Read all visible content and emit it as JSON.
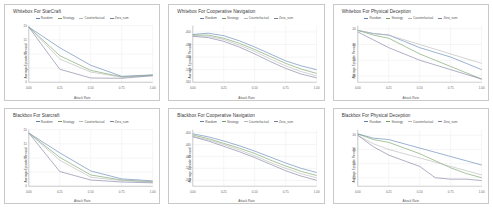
{
  "figure": {
    "name": "attack-rate-reward-grid",
    "rows": 2,
    "cols": 3,
    "background": "#ffffff"
  },
  "legend_series": [
    {
      "key": "random",
      "label": "Random",
      "color": "#5b7fb5"
    },
    {
      "key": "strategy",
      "label": "Strategy",
      "color": "#6f9e5e"
    },
    {
      "key": "counterfactual",
      "label": "Counterfactual",
      "color": "#b6b6b6"
    },
    {
      "key": "zero_sum",
      "label": "Zero_sum",
      "color": "#7b7b9e"
    }
  ],
  "axes": {
    "xlabel": "Attack Rate",
    "ylabel": "Average Episode Reward",
    "xticks": [
      "0.00",
      "0.25",
      "0.50",
      "0.75",
      "1.00"
    ],
    "xlim": [
      0,
      1
    ],
    "grid": true
  },
  "chart_data": [
    {
      "id": "whitebox-starcraft",
      "type": "line",
      "title": "Whitebox For StarCraft",
      "xlabel": "Attack Rate",
      "ylabel": "Average Episode Reward",
      "x": [
        0.0,
        0.25,
        0.5,
        0.75,
        1.0
      ],
      "ylim": [
        0,
        20
      ],
      "yticks": [
        "0",
        "5",
        "10",
        "15",
        "20"
      ],
      "series": [
        {
          "name": "Random",
          "values": [
            19.5,
            12.2,
            6.0,
            2.1,
            2.6
          ]
        },
        {
          "name": "Strategy",
          "values": [
            19.5,
            9.4,
            4.2,
            1.9,
            2.5
          ]
        },
        {
          "name": "Counterfactual",
          "values": [
            19.5,
            8.2,
            3.6,
            1.8,
            2.4
          ]
        },
        {
          "name": "Zero_sum",
          "values": [
            19.5,
            4.6,
            1.5,
            1.4,
            2.3
          ]
        }
      ]
    },
    {
      "id": "whitebox-cooperative-navigation",
      "type": "line",
      "title": "Whitebox For Cooperative Navigation",
      "xlabel": "Attack Rate",
      "ylabel": "Average Episode Reward",
      "x": [
        0.0,
        0.125,
        0.25,
        0.375,
        0.5,
        0.625,
        0.75,
        0.875,
        1.0
      ],
      "ylim": [
        -560,
        -380
      ],
      "yticks": [
        "-400",
        "-440",
        "-480",
        "-520",
        "-560"
      ],
      "series": [
        {
          "name": "Random",
          "values": [
            -408,
            -404,
            -412,
            -428,
            -448,
            -470,
            -492,
            -508,
            -520
          ]
        },
        {
          "name": "Strategy",
          "values": [
            -410,
            -410,
            -420,
            -436,
            -456,
            -478,
            -500,
            -518,
            -532
          ]
        },
        {
          "name": "Counterfactual",
          "values": [
            -412,
            -414,
            -424,
            -442,
            -462,
            -486,
            -508,
            -526,
            -540
          ]
        },
        {
          "name": "Zero_sum",
          "values": [
            -414,
            -418,
            -430,
            -448,
            -470,
            -494,
            -516,
            -534,
            -546
          ]
        }
      ]
    },
    {
      "id": "whitebox-physical-deception",
      "type": "line",
      "title": "Whitebox For Physical Deception",
      "xlabel": "Attack Rate",
      "ylabel": "Average Episode Reward",
      "x": [
        0.0,
        0.125,
        0.25,
        0.375,
        0.5,
        0.625,
        0.75,
        0.875,
        1.0
      ],
      "ylim": [
        -64,
        -28
      ],
      "yticks": [
        "-30",
        "-40",
        "-50",
        "-60"
      ],
      "series": [
        {
          "name": "Random",
          "values": [
            -31,
            -33,
            -34,
            -38,
            -42,
            -45,
            -48,
            -52,
            -56
          ]
        },
        {
          "name": "Strategy",
          "values": [
            -31,
            -34,
            -36,
            -41,
            -46,
            -50,
            -54,
            -58,
            -62
          ]
        },
        {
          "name": "Counterfactual",
          "values": [
            -31,
            -33,
            -34,
            -37,
            -40,
            -43,
            -46,
            -49,
            -52
          ]
        },
        {
          "name": "Zero_sum",
          "values": [
            -32,
            -37,
            -42,
            -46,
            -50,
            -53,
            -56,
            -59,
            -62
          ]
        }
      ]
    },
    {
      "id": "blackbox-starcraft",
      "type": "line",
      "title": "Blackbox For Starcraft",
      "xlabel": "Attack Rate",
      "ylabel": "Average Episode Reward",
      "x": [
        0.0,
        0.25,
        0.5,
        0.75,
        1.0
      ],
      "ylim": [
        0,
        20
      ],
      "yticks": [
        "0",
        "5",
        "10",
        "15",
        "20"
      ],
      "series": [
        {
          "name": "Random",
          "values": [
            18.8,
            11.8,
            5.4,
            2.6,
            1.9
          ]
        },
        {
          "name": "Strategy",
          "values": [
            18.8,
            10.2,
            4.0,
            2.2,
            1.6
          ]
        },
        {
          "name": "Counterfactual",
          "values": [
            18.8,
            9.2,
            3.2,
            2.0,
            1.5
          ]
        },
        {
          "name": "Zero_sum",
          "values": [
            18.8,
            5.2,
            2.2,
            1.5,
            1.2
          ]
        }
      ]
    },
    {
      "id": "blackbox-cooperative-navigation",
      "type": "line",
      "title": "Blackbox For Cooperative Navigation",
      "xlabel": "Attack Rate",
      "ylabel": "Average Episode Reward",
      "x": [
        0.0,
        0.125,
        0.25,
        0.375,
        0.5,
        0.625,
        0.75,
        0.875,
        1.0
      ],
      "ylim": [
        -580,
        -390
      ],
      "yticks": [
        "-400",
        "-440",
        "-480",
        "-520",
        "-560"
      ],
      "series": [
        {
          "name": "Random",
          "values": [
            -404,
            -414,
            -428,
            -444,
            -462,
            -482,
            -502,
            -520,
            -534
          ]
        },
        {
          "name": "Strategy",
          "values": [
            -408,
            -420,
            -436,
            -452,
            -470,
            -492,
            -512,
            -530,
            -544
          ]
        },
        {
          "name": "Counterfactual",
          "values": [
            -412,
            -424,
            -440,
            -458,
            -478,
            -500,
            -520,
            -538,
            -552
          ]
        },
        {
          "name": "Zero_sum",
          "values": [
            -414,
            -428,
            -446,
            -464,
            -484,
            -506,
            -528,
            -546,
            -560
          ]
        }
      ]
    },
    {
      "id": "blackbox-physical-deception",
      "type": "line",
      "title": "Blackbox For Physical Deception",
      "xlabel": "Attack Rate",
      "ylabel": "Average Episode Reward",
      "x": [
        0.0,
        0.125,
        0.25,
        0.375,
        0.5,
        0.625,
        0.75,
        0.875,
        1.0
      ],
      "ylim": [
        -66,
        -26
      ],
      "yticks": [
        "-30",
        "-40",
        "-50",
        "-60"
      ],
      "series": [
        {
          "name": "Random",
          "values": [
            -29,
            -32,
            -33,
            -36,
            -39,
            -42,
            -45,
            -48,
            -51
          ]
        },
        {
          "name": "Strategy",
          "values": [
            -29,
            -33,
            -35,
            -39,
            -43,
            -48,
            -53,
            -57,
            -60
          ]
        },
        {
          "name": "Counterfactual",
          "values": [
            -30,
            -36,
            -40,
            -43,
            -46,
            -49,
            -52,
            -55,
            -58
          ]
        },
        {
          "name": "Zero_sum",
          "values": [
            -30,
            -38,
            -44,
            -48,
            -52,
            -60,
            -61,
            -61,
            -62
          ]
        }
      ]
    }
  ]
}
